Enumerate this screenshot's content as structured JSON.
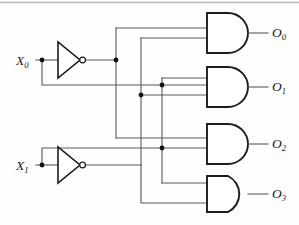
{
  "diagram": {
    "type": "logic-circuit",
    "background_color": "#fdfdfd",
    "wire_color": "#5a5a5a",
    "gate_color": "#1c1c1c"
  },
  "inputs": [
    {
      "id": "X0",
      "base": "X",
      "subscript": "0",
      "label": "X0",
      "y": 60
    },
    {
      "id": "X1",
      "base": "X",
      "subscript": "1",
      "label": "X1",
      "y": 165
    }
  ],
  "inverters": [
    {
      "id": "inv0",
      "input": "X0",
      "output": "X0_not",
      "label": "NOT"
    },
    {
      "id": "inv1",
      "input": "X1",
      "output": "X1_not",
      "label": "NOT"
    }
  ],
  "gates": [
    {
      "id": "and0",
      "type": "AND",
      "inputs": [
        "X0_not",
        "X1_not"
      ],
      "output": "O0"
    },
    {
      "id": "and1",
      "type": "AND",
      "inputs": [
        "X0",
        "X1_not"
      ],
      "output": "O1"
    },
    {
      "id": "and2",
      "type": "AND",
      "inputs": [
        "X0_not",
        "X1"
      ],
      "output": "O2"
    },
    {
      "id": "and3",
      "type": "AND",
      "inputs": [
        "X0",
        "X1"
      ],
      "output": "O3"
    }
  ],
  "outputs": [
    {
      "id": "O0",
      "base": "O",
      "subscript": "0",
      "label": "O0",
      "y": 28
    },
    {
      "id": "O1",
      "base": "O",
      "subscript": "1",
      "label": "O1",
      "y": 85
    },
    {
      "id": "O2",
      "base": "O",
      "subscript": "2",
      "label": "O2",
      "y": 138
    },
    {
      "id": "O3",
      "base": "O",
      "subscript": "3",
      "label": "O3",
      "y": 192
    }
  ],
  "junction_count": 6
}
